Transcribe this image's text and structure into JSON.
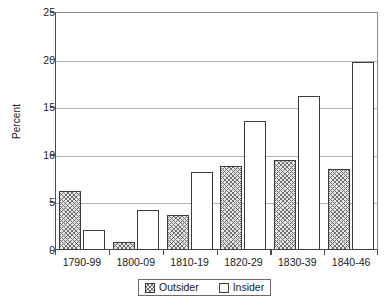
{
  "chart_data": {
    "type": "bar",
    "title": "",
    "subtitle": "",
    "xlabel": "",
    "ylabel": "Percent",
    "categories": [
      "1790-99",
      "1800-09",
      "1810-19",
      "1820-29",
      "1830-39",
      "1840-46"
    ],
    "series": [
      {
        "name": "Outsider",
        "values": [
          6.2,
          0.8,
          3.7,
          8.8,
          9.5,
          8.5
        ]
      },
      {
        "name": "Insider",
        "values": [
          2.1,
          4.2,
          8.2,
          13.6,
          16.2,
          19.7
        ]
      }
    ],
    "ylim": [
      0,
      25
    ],
    "yticks": [
      0,
      5,
      10,
      15,
      20,
      25
    ],
    "ytick_labels": [
      "0",
      "5",
      "10",
      "15",
      "20",
      "25"
    ],
    "grid": true,
    "grid_axis": "y",
    "legend_position": "bottom",
    "legend_entries": [
      {
        "label": "Outsider",
        "swatch": "hatched-swatch"
      },
      {
        "label": "Insider",
        "swatch": "open-swatch"
      }
    ],
    "colors": {
      "outsider_fill": "#e8e8e8",
      "outsider_hatch": "#6e6e6e",
      "insider_fill": "#ffffff",
      "bar_outline": "#3c3c3c",
      "axis": "#4d4d4d",
      "gridline": "#b0b0b0",
      "text": "#1a1a1a",
      "background": "#ffffff"
    }
  }
}
